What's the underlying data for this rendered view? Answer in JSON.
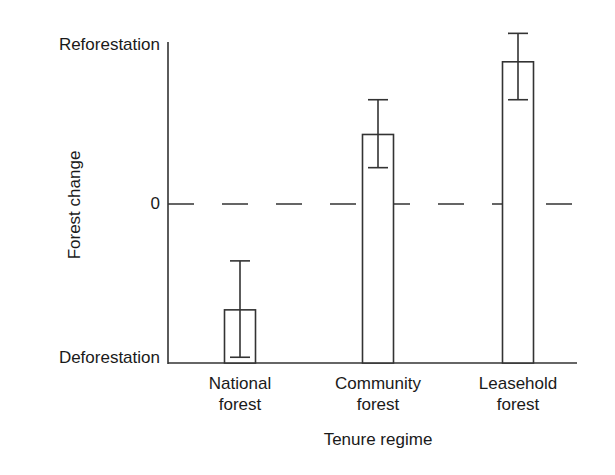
{
  "chart_data": {
    "type": "bar",
    "title": "",
    "xlabel": "Tenure regime",
    "ylabel": "Forest change",
    "categories": [
      "National forest",
      "Community forest",
      "Leasehold forest"
    ],
    "category_lines": [
      [
        "National",
        "forest"
      ],
      [
        "Community",
        "forest"
      ],
      [
        "Leasehold",
        "forest"
      ]
    ],
    "values": [
      -0.67,
      0.44,
      0.9
    ],
    "error_low": [
      -0.97,
      0.23,
      0.66
    ],
    "error_high": [
      -0.36,
      0.66,
      1.08
    ],
    "ylim": [
      -1,
      1
    ],
    "y_tick_labels": [
      {
        "value": 1,
        "label": "Reforestation"
      },
      {
        "value": 0,
        "label": "0"
      },
      {
        "value": -1,
        "label": "Deforestation"
      }
    ],
    "reference_line": {
      "value": 0,
      "style": "dashed"
    },
    "grid": false,
    "legend": null,
    "bar_fill": "#ffffff",
    "bar_stroke": "#333333"
  }
}
